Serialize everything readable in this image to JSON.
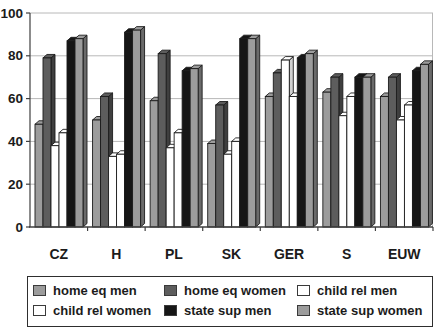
{
  "chart_data": {
    "type": "bar",
    "style": "grouped-3d-grayscale",
    "title": "",
    "xlabel": "",
    "ylabel": "",
    "categories": [
      "CZ",
      "H",
      "PL",
      "SK",
      "GER",
      "S",
      "EUW"
    ],
    "series": [
      {
        "name": "home eq men",
        "color": "#9c9c9c",
        "values": [
          48,
          50,
          59,
          39,
          61,
          63,
          61
        ]
      },
      {
        "name": "home eq women",
        "color": "#5d5d5d",
        "values": [
          79,
          61,
          81,
          57,
          72,
          70,
          70
        ]
      },
      {
        "name": "child rel men",
        "color": "#ffffff",
        "values": [
          38,
          33,
          37,
          34,
          78,
          52,
          50
        ]
      },
      {
        "name": "child rel women",
        "color": "#ffffff",
        "values": [
          44,
          34,
          44,
          40,
          61,
          61,
          57
        ]
      },
      {
        "name": "state sup men",
        "color": "#161616",
        "values": [
          87,
          91,
          73,
          88,
          79,
          70,
          73
        ]
      },
      {
        "name": "state sup women",
        "color": "#9c9c9c",
        "values": [
          88,
          92,
          74,
          88,
          81,
          70,
          76
        ]
      }
    ],
    "ylim": [
      0,
      100
    ],
    "yticks": [
      0,
      20,
      40,
      60,
      80,
      100
    ],
    "grid": true,
    "gridline_color": "#b8b8b8",
    "axis_color": "#3f3f3f",
    "bar_outline_color": "#1c1c1c",
    "legend_position": "bottom",
    "legend_border_color": "#2e2e2e"
  }
}
